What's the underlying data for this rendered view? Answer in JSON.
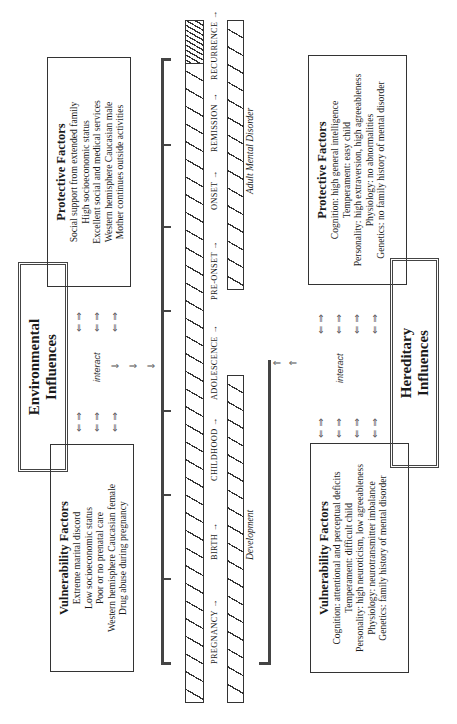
{
  "environmental": {
    "influences_title": [
      "Environmental",
      "Influences"
    ],
    "protective": {
      "title": "Protective Factors",
      "items": [
        "Social support from extended family",
        "High socioeconomic status",
        "Excellent social and medical services",
        "Western hemisphere Caucasian male",
        "Mother continues outside activities"
      ]
    },
    "vulnerability": {
      "title": "Vulnerability Factors",
      "items": [
        "Extreme marital discord",
        "Low socioeconomic status",
        "Poor or no prenatal care",
        "Western hemisphere Caucasian female",
        "Drug abuse during pregnancy"
      ]
    },
    "interact_label": "interact"
  },
  "hereditary": {
    "influences_title": [
      "Hereditary",
      "Influences"
    ],
    "protective": {
      "title": "Protective Factors",
      "items": [
        "Cognition: high general intelligence",
        "Temperament: easy child",
        "Personality: high extraversion, high agreeableness",
        "Physiology: no abnormalities",
        "Genetics: no family history of mental disorder"
      ]
    },
    "vulnerability": {
      "title": "Vulnerability Factors",
      "items": [
        "Cognition: attentional and perceptual deficits",
        "Temperament: difficult child",
        "Personality: high neuroticism, low agreeableness",
        "Physiology: neurotransmitter imbalance",
        "Genetics: family history of mental disorder"
      ]
    },
    "interact_label": "interact"
  },
  "timeline": {
    "stages": [
      "PREGNANCY →",
      "BIRTH →",
      "CHILDHOOD →",
      "ADOLESCENCE →",
      "PRE-ONSET →",
      "ONSET →",
      "REMISSION →",
      "RECURRENCE →"
    ],
    "development_label": "Development",
    "disorder_label": "Adult Mental Disorder"
  },
  "arrows": {
    "bidirectional": "⇐ ⇒",
    "right": "⇒",
    "left": "⇐",
    "tick": "→"
  }
}
